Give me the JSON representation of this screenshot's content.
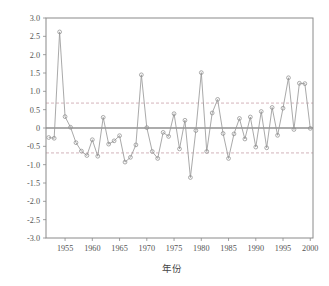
{
  "figure": {
    "background_color": "#ffffff",
    "axis_color": "#8a8a8a",
    "series_color": "#9a9a9a",
    "zero_line_color": "#5a5a5a",
    "ref_line_color": "#c8a0a8"
  },
  "chart_data": {
    "type": "line",
    "title": "",
    "subtitle": "",
    "xlabel": "年份",
    "ylabel": "",
    "xlim": [
      1951.5,
      2000.5
    ],
    "ylim": [
      -3.0,
      3.0
    ],
    "grid": false,
    "legend": null,
    "marker": "open-circle",
    "xticks": [
      1955,
      1960,
      1965,
      1970,
      1975,
      1980,
      1985,
      1990,
      1995,
      2000
    ],
    "xtick_labels": [
      "1955",
      "1960",
      "1965",
      "1970",
      "1975",
      "1980",
      "1985",
      "1990",
      "1995",
      "2000"
    ],
    "yticks": [
      -3.0,
      -2.5,
      -2.0,
      -1.5,
      -1.0,
      -0.5,
      0,
      0.5,
      1.0,
      1.5,
      2.0,
      2.5,
      3.0
    ],
    "ytick_labels": [
      "-3.0",
      "-2.5",
      "-2.0",
      "-1.5",
      "-1.0",
      "-0.5",
      "0",
      "0.5",
      "1.0",
      "1.5",
      "2.0",
      "2.5",
      "3.0"
    ],
    "reference_lines": [
      {
        "value": 0,
        "style": "solid",
        "color": "#5a5a5a"
      },
      {
        "value": 0.68,
        "style": "dashed",
        "color": "#c8a0a8"
      },
      {
        "value": -0.68,
        "style": "dashed",
        "color": "#c8a0a8"
      }
    ],
    "x": [
      1952,
      1953,
      1954,
      1955,
      1956,
      1957,
      1958,
      1959,
      1960,
      1961,
      1962,
      1963,
      1964,
      1965,
      1966,
      1967,
      1968,
      1969,
      1970,
      1971,
      1972,
      1973,
      1974,
      1975,
      1976,
      1977,
      1978,
      1979,
      1980,
      1981,
      1982,
      1983,
      1984,
      1985,
      1986,
      1987,
      1988,
      1989,
      1990,
      1991,
      1992,
      1993,
      1994,
      1995,
      1996,
      1997,
      1998,
      1999,
      2000
    ],
    "values": [
      -0.26,
      -0.28,
      2.62,
      0.31,
      0.02,
      -0.4,
      -0.63,
      -0.75,
      -0.32,
      -0.77,
      0.29,
      -0.44,
      -0.35,
      -0.21,
      -0.93,
      -0.8,
      -0.46,
      1.45,
      0.01,
      -0.64,
      -0.83,
      -0.12,
      -0.23,
      0.39,
      -0.57,
      0.21,
      -1.35,
      -0.07,
      1.51,
      -0.64,
      0.41,
      0.78,
      -0.15,
      -0.83,
      -0.16,
      0.26,
      -0.3,
      0.3,
      -0.52,
      0.45,
      -0.54,
      0.56,
      -0.2,
      0.54,
      1.37,
      -0.04,
      1.22,
      1.21,
      -0.01
    ],
    "series": [
      {
        "name": "series-1",
        "values": [
          -0.26,
          -0.28,
          2.62,
          0.31,
          0.02,
          -0.4,
          -0.63,
          -0.75,
          -0.32,
          -0.77,
          0.29,
          -0.44,
          -0.35,
          -0.21,
          -0.93,
          -0.8,
          -0.46,
          1.45,
          0.01,
          -0.64,
          -0.83,
          -0.12,
          -0.23,
          0.39,
          -0.57,
          0.21,
          -1.35,
          -0.07,
          1.51,
          -0.64,
          0.41,
          0.78,
          -0.15,
          -0.83,
          -0.16,
          0.26,
          -0.3,
          0.3,
          -0.52,
          0.45,
          -0.54,
          0.56,
          -0.2,
          0.54,
          1.37,
          -0.04,
          1.22,
          1.21,
          -0.01
        ]
      }
    ]
  }
}
